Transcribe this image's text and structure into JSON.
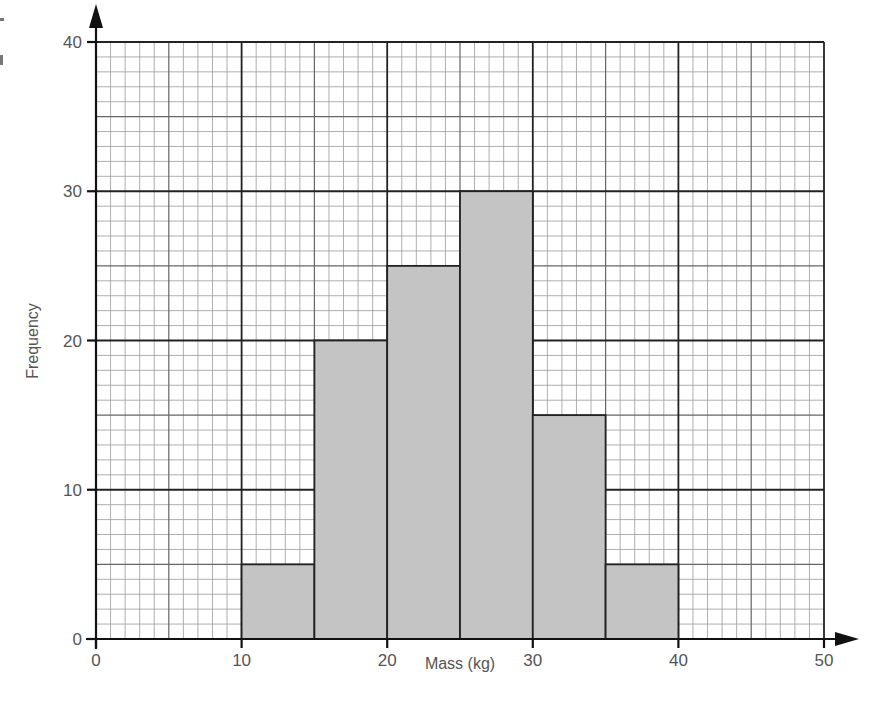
{
  "chart_data": {
    "type": "bar",
    "subtype": "histogram",
    "title": "",
    "xlabel": "Mass (kg)",
    "ylabel": "Frequency",
    "xlim": [
      0,
      50
    ],
    "ylim": [
      0,
      40
    ],
    "x_ticks": [
      0,
      10,
      20,
      30,
      40,
      50
    ],
    "y_ticks": [
      0,
      10,
      20,
      30,
      40
    ],
    "x_tick_labels": [
      "0",
      "10",
      "20",
      "30",
      "40",
      "50"
    ],
    "y_tick_labels": [
      "0",
      "10",
      "20",
      "30",
      "40"
    ],
    "grid": true,
    "grid_minor_step": {
      "x": 1,
      "y": 1
    },
    "grid_medium_step": {
      "x": 5,
      "y": 5
    },
    "grid_major_step": {
      "x": 10,
      "y": 10
    },
    "legend": null,
    "categories": [
      "10-15",
      "15-20",
      "20-25",
      "25-30",
      "30-35",
      "35-40"
    ],
    "bins": [
      {
        "from": 10,
        "to": 15,
        "frequency": 5
      },
      {
        "from": 15,
        "to": 20,
        "frequency": 20
      },
      {
        "from": 20,
        "to": 25,
        "frequency": 25
      },
      {
        "from": 25,
        "to": 30,
        "frequency": 30
      },
      {
        "from": 30,
        "to": 35,
        "frequency": 15
      },
      {
        "from": 35,
        "to": 40,
        "frequency": 5
      }
    ],
    "values": [
      5,
      20,
      25,
      30,
      15,
      5
    ]
  },
  "colors": {
    "bar_fill": "#c4c4c4",
    "bar_stroke": "#222222",
    "background": "#ffffff",
    "text": "#555555"
  },
  "axes": {
    "x_title": "Mass (kg)",
    "y_title": "Frequency"
  }
}
